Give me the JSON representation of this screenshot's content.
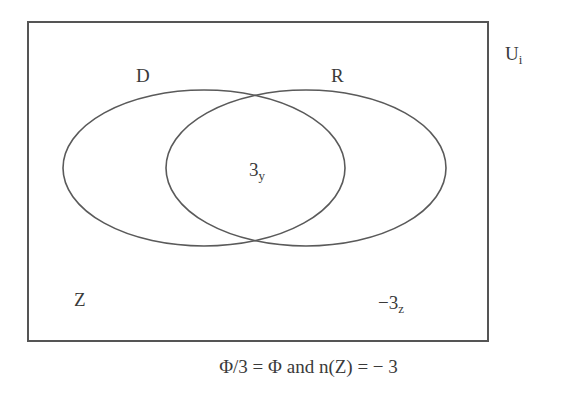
{
  "diagram": {
    "type": "venn",
    "universe": {
      "label": "U",
      "subscript": "i"
    },
    "sets": [
      {
        "id": "D",
        "label": "D"
      },
      {
        "id": "R",
        "label": "R"
      }
    ],
    "regions": {
      "intersection": {
        "value": "3",
        "subscript": "y"
      },
      "outside_label": "Z",
      "outside": {
        "value": "−3",
        "subscript": "z"
      }
    },
    "caption": "Φ/3 = Φ and n(Z) = − 3",
    "colors": {
      "stroke": "#555555",
      "background": "#ffffff",
      "text": "#3a3a3a"
    }
  }
}
